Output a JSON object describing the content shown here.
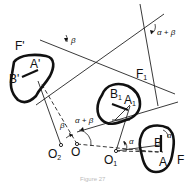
{
  "diagram": {
    "type": "geometric construction - rotation of planar figure about pivot points",
    "bodies": [
      {
        "id": "F",
        "label": "F",
        "points": [
          "A",
          "B"
        ]
      },
      {
        "id": "F1",
        "label": "F",
        "label_sub": "1",
        "points": [
          "A1",
          "B1"
        ]
      },
      {
        "id": "F'",
        "label": "F'",
        "points": [
          "A'",
          "B'"
        ]
      }
    ],
    "labels": {
      "F": "F",
      "F1_main": "F",
      "F1_sub": "1",
      "F_prime": "F'",
      "A": "A",
      "B": "B",
      "A1_main": "A",
      "A1_sub": "1",
      "B1_main": "B",
      "B1_sub": "1",
      "A_prime": "A'",
      "B_prime": "B'",
      "O": "O",
      "O1_main": "O",
      "O1_sub": "1",
      "O2_main": "O",
      "O2_sub": "2"
    },
    "angles": {
      "alpha": "α",
      "beta": "β",
      "alpha_plus_beta": "α + β"
    },
    "pivots": [
      "O",
      "O1",
      "O2"
    ],
    "caption": "Figure 27"
  }
}
